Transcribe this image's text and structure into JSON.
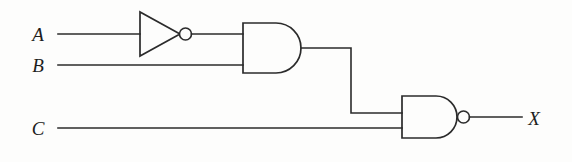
{
  "diagram": {
    "background_color": "#fdfdfc",
    "line_color": "#2b2b2b",
    "inputs": [
      {
        "id": "A",
        "label": "A",
        "x": 38,
        "y": 41
      },
      {
        "id": "B",
        "label": "B",
        "x": 38,
        "y": 72
      },
      {
        "id": "C",
        "label": "C",
        "x": 38,
        "y": 135
      }
    ],
    "outputs": [
      {
        "id": "X",
        "label": "X",
        "x": 534,
        "y": 125
      }
    ],
    "gates": [
      {
        "id": "not1",
        "type": "NOT",
        "label": "NOT gate",
        "inputs": [
          "A"
        ],
        "output": "notA"
      },
      {
        "id": "and1",
        "type": "AND",
        "label": "AND gate",
        "inputs": [
          "notA",
          "B"
        ],
        "output": "and_out"
      },
      {
        "id": "nand1",
        "type": "NAND",
        "label": "NAND gate",
        "inputs": [
          "and_out",
          "C"
        ],
        "output": "X"
      }
    ],
    "wires": [
      {
        "id": "wire-a-in",
        "from": "A",
        "to": "not1"
      },
      {
        "id": "wire-not-to-and",
        "from": "not1",
        "to": "and1"
      },
      {
        "id": "wire-b-in",
        "from": "B",
        "to": "and1"
      },
      {
        "id": "wire-and-to-nand",
        "from": "and1",
        "to": "nand1"
      },
      {
        "id": "wire-c-in",
        "from": "C",
        "to": "nand1"
      },
      {
        "id": "wire-nand-out",
        "from": "nand1",
        "to": "X"
      }
    ],
    "expression": "X = NOT( (NOT A) AND B AND C )"
  }
}
